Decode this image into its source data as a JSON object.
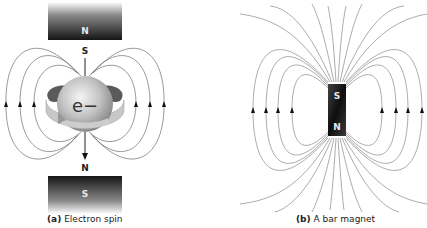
{
  "panel_a": {
    "caption_letter": "(a)",
    "caption_text": "Electron spin",
    "top_magnet_label": "N",
    "bottom_magnet_label": "S",
    "electron_top_pole": "S",
    "electron_bottom_pole": "N",
    "electron_label": "e−"
  },
  "panel_b": {
    "caption_letter": "(b)",
    "caption_text": "A bar magnet",
    "magnet_top_label": "S",
    "magnet_bottom_label": "N"
  },
  "colors": {
    "field_line": "#555555",
    "magnet_dark": "#1a1a1a",
    "electron_sphere": "#b8b8b8"
  }
}
